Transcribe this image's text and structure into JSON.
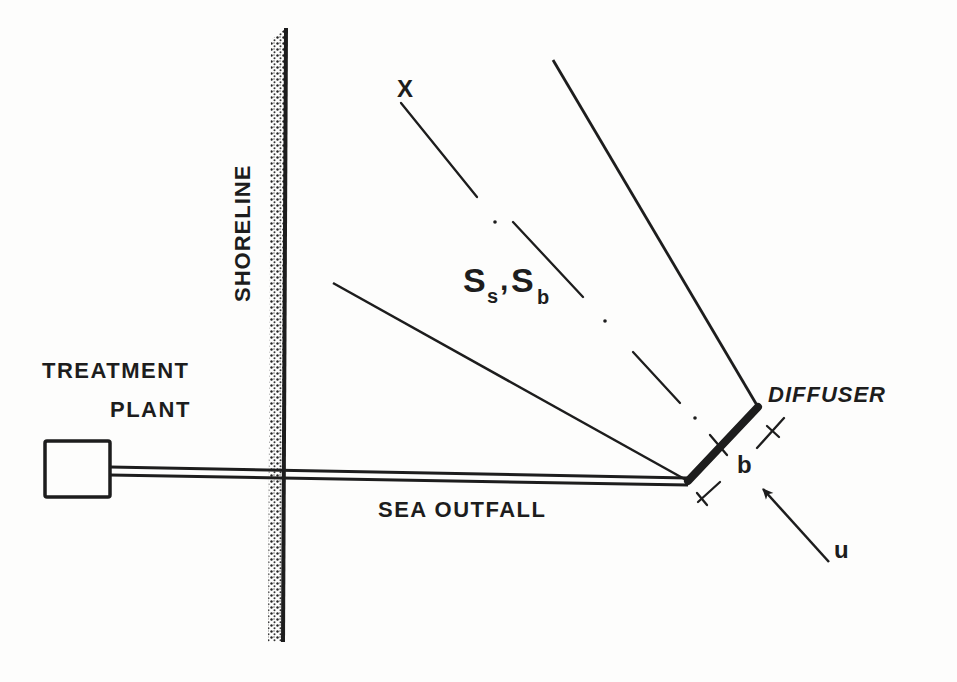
{
  "diagram": {
    "type": "schematic",
    "title": "",
    "labels": {
      "treatment_line1": "TREATMENT",
      "treatment_line2": "PLANT",
      "shoreline": "SHORELINE",
      "sea_outfall": "SEA OUTFALL",
      "diffuser": "DIFFUSER",
      "axis_x": "X",
      "diffuser_length": "b",
      "current_velocity": "u",
      "dilution_main_s1": "S",
      "dilution_sub_s1": "s",
      "dilution_sep": ",",
      "dilution_main_s2": "S",
      "dilution_sub_s2": "b"
    },
    "elements": [
      {
        "id": "treatment-plant",
        "shape": "rectangle"
      },
      {
        "id": "sea-outfall-pipe",
        "shape": "double-line",
        "from": "treatment-plant",
        "to": "diffuser"
      },
      {
        "id": "shoreline",
        "shape": "stippled-vertical-line"
      },
      {
        "id": "diffuser",
        "shape": "thick-line-segment"
      },
      {
        "id": "plume-boundary-left",
        "shape": "line"
      },
      {
        "id": "plume-boundary-right",
        "shape": "line"
      },
      {
        "id": "plume-centerline",
        "shape": "dash-dot-line",
        "label": "X"
      },
      {
        "id": "diffuser-length-dimension",
        "shape": "dimension",
        "label": "b"
      },
      {
        "id": "current-arrow",
        "shape": "arrow",
        "label": "u"
      }
    ],
    "colors": {
      "ink": "#1d1d1d",
      "paper": "#fdfdfc"
    }
  }
}
